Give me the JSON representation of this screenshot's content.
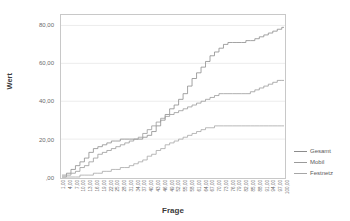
{
  "chart_data": {
    "type": "line",
    "title": "",
    "subtitle": "",
    "xlabel": "Frage",
    "ylabel": "Wert",
    "xlim": [
      1,
      100
    ],
    "ylim": [
      0,
      85
    ],
    "grid": true,
    "legend_position": "right",
    "y_ticks": [
      {
        "value": 0,
        "label": ",00"
      },
      {
        "value": 20,
        "label": "20,00"
      },
      {
        "value": 40,
        "label": "40,00"
      },
      {
        "value": 60,
        "label": "60,00"
      },
      {
        "value": 80,
        "label": "80,00"
      }
    ],
    "x_ticks": [
      {
        "value": 1,
        "label": "1,00"
      },
      {
        "value": 4,
        "label": "4,00"
      },
      {
        "value": 7,
        "label": "7,00"
      },
      {
        "value": 10,
        "label": "10,00"
      },
      {
        "value": 13,
        "label": "13,00"
      },
      {
        "value": 16,
        "label": "16,00"
      },
      {
        "value": 19,
        "label": "19,00"
      },
      {
        "value": 22,
        "label": "22,00"
      },
      {
        "value": 25,
        "label": "25,00"
      },
      {
        "value": 28,
        "label": "28,00"
      },
      {
        "value": 31,
        "label": "31,00"
      },
      {
        "value": 34,
        "label": "34,00"
      },
      {
        "value": 37,
        "label": "37,00"
      },
      {
        "value": 40,
        "label": "40,00"
      },
      {
        "value": 43,
        "label": "43,00"
      },
      {
        "value": 46,
        "label": "46,00"
      },
      {
        "value": 49,
        "label": "49,00"
      },
      {
        "value": 52,
        "label": "52,00"
      },
      {
        "value": 55,
        "label": "55,00"
      },
      {
        "value": 58,
        "label": "58,00"
      },
      {
        "value": 61,
        "label": "61,00"
      },
      {
        "value": 64,
        "label": "64,00"
      },
      {
        "value": 67,
        "label": "67,00"
      },
      {
        "value": 70,
        "label": "70,00"
      },
      {
        "value": 73,
        "label": "73,00"
      },
      {
        "value": 76,
        "label": "76,00"
      },
      {
        "value": 79,
        "label": "79,00"
      },
      {
        "value": 82,
        "label": "82,00"
      },
      {
        "value": 85,
        "label": "85,00"
      },
      {
        "value": 88,
        "label": "88,00"
      },
      {
        "value": 91,
        "label": "91,00"
      },
      {
        "value": 94,
        "label": "94,00"
      },
      {
        "value": 97,
        "label": "97,00"
      },
      {
        "value": 100,
        "label": "100,00"
      }
    ],
    "series": [
      {
        "name": "Gesamt",
        "color": "#8c8c8c",
        "x": [
          1,
          3,
          5,
          7,
          9,
          11,
          13,
          15,
          17,
          19,
          21,
          23,
          25,
          27,
          29,
          31,
          33,
          35,
          37,
          39,
          41,
          43,
          45,
          47,
          49,
          51,
          53,
          55,
          57,
          59,
          61,
          63,
          65,
          67,
          69,
          71,
          73,
          75,
          77,
          79,
          81,
          83,
          85,
          87,
          89,
          91,
          93,
          95,
          97,
          99,
          100
        ],
        "values": [
          1,
          2,
          4,
          6,
          8,
          10,
          13,
          15,
          16,
          17,
          18,
          19,
          19,
          20,
          20,
          20,
          20,
          20,
          21,
          22,
          24,
          27,
          30,
          33,
          36,
          38,
          41,
          44,
          48,
          52,
          55,
          58,
          61,
          64,
          66,
          68,
          70,
          71,
          71,
          71,
          71,
          72,
          72,
          73,
          74,
          75,
          76,
          77,
          78,
          79,
          79
        ]
      },
      {
        "name": "Mobil",
        "color": "#9a9a9a",
        "x": [
          1,
          3,
          5,
          7,
          9,
          11,
          13,
          15,
          17,
          19,
          21,
          23,
          25,
          27,
          29,
          31,
          33,
          35,
          37,
          39,
          41,
          43,
          45,
          47,
          49,
          51,
          53,
          55,
          57,
          59,
          61,
          63,
          65,
          67,
          69,
          71,
          73,
          75,
          77,
          79,
          81,
          83,
          85,
          87,
          89,
          91,
          93,
          95,
          97,
          99,
          100
        ],
        "values": [
          0,
          1,
          2,
          3,
          5,
          6,
          8,
          10,
          12,
          13,
          14,
          15,
          16,
          17,
          18,
          19,
          20,
          21,
          23,
          25,
          27,
          29,
          31,
          32,
          33,
          34,
          35,
          36,
          37,
          38,
          39,
          40,
          41,
          42,
          43,
          44,
          44,
          44,
          44,
          44,
          44,
          44,
          45,
          46,
          47,
          48,
          49,
          50,
          51,
          51,
          51
        ]
      },
      {
        "name": "Festnetz",
        "color": "#a6a6a6",
        "x": [
          1,
          3,
          5,
          7,
          9,
          11,
          13,
          15,
          17,
          19,
          21,
          23,
          25,
          27,
          29,
          31,
          33,
          35,
          37,
          39,
          41,
          43,
          45,
          47,
          49,
          51,
          53,
          55,
          57,
          59,
          61,
          63,
          65,
          67,
          69,
          71,
          73,
          75,
          77,
          79,
          81,
          83,
          85,
          87,
          89,
          91,
          93,
          95,
          97,
          99,
          100
        ],
        "values": [
          0,
          0,
          0,
          0,
          1,
          1,
          1,
          2,
          2,
          3,
          3,
          4,
          4,
          5,
          5,
          6,
          7,
          8,
          9,
          11,
          12,
          14,
          15,
          17,
          18,
          19,
          20,
          21,
          22,
          23,
          24,
          25,
          26,
          26,
          27,
          27,
          27,
          27,
          27,
          27,
          27,
          27,
          27,
          27,
          27,
          27,
          27,
          27,
          27,
          27,
          27
        ]
      }
    ]
  },
  "legend": {
    "items": [
      {
        "label": "Gesamt"
      },
      {
        "label": "Mobil"
      },
      {
        "label": "Festnetz"
      }
    ]
  },
  "axis_titles": {
    "y": "Wert",
    "x": "Frage"
  }
}
